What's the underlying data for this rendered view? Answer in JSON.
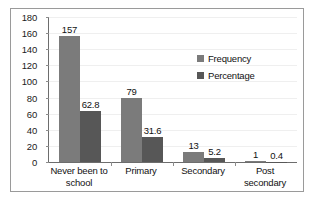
{
  "chart_data": {
    "type": "bar",
    "title": "",
    "xlabel": "",
    "ylabel": "",
    "ylim": [
      0,
      180
    ],
    "ytick_step": 20,
    "yticks": [
      "180",
      "160",
      "140",
      "120",
      "100",
      "80",
      "60",
      "40",
      "20",
      "0"
    ],
    "grid": true,
    "legend_position": "inside-upper-right",
    "categories": [
      "Never been to school",
      "Primary",
      "Secondary",
      "Post secondary"
    ],
    "category_lines": [
      [
        "Never been to",
        "school"
      ],
      [
        "Primary",
        ""
      ],
      [
        "Secondary",
        ""
      ],
      [
        "Post secondary",
        ""
      ]
    ],
    "series": [
      {
        "name": "Frequency",
        "color": "#7b7b7b",
        "values": [
          157,
          79,
          13,
          1
        ],
        "labels": [
          "157",
          "79",
          "13",
          "1"
        ]
      },
      {
        "name": "Percentage",
        "color": "#575757",
        "values": [
          62.8,
          31.6,
          5.2,
          0.4
        ],
        "labels": [
          "62.8",
          "31.6",
          "5.2",
          "0.4"
        ]
      }
    ]
  },
  "colors": {
    "frequency": "#7b7b7b",
    "percentage": "#575757",
    "axis": "#6d6d6d",
    "gridline": "#efefef",
    "frame": "#9a9a9a",
    "text": "#111111"
  }
}
